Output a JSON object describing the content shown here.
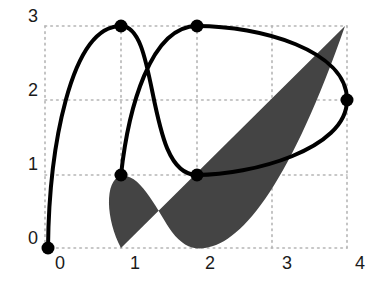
{
  "figure": {
    "axes": {
      "x_ticks": [
        "0",
        "1",
        "2",
        "3",
        "4"
      ],
      "y_ticks": [
        "0",
        "1",
        "2",
        "3"
      ],
      "x_range": [
        0,
        4
      ],
      "y_range": [
        0,
        3
      ]
    },
    "spline_points": [
      {
        "x": 0,
        "y": 0
      },
      {
        "x": 1,
        "y": 3
      },
      {
        "x": 2,
        "y": 1
      },
      {
        "x": 4,
        "y": 2
      },
      {
        "x": 2,
        "y": 3
      },
      {
        "x": 1,
        "y": 1
      }
    ],
    "shaded_region": {
      "start": {
        "x": 1,
        "y": 0
      },
      "end": {
        "x": 4,
        "y": 3
      },
      "fill": "#444444"
    },
    "colors": {
      "curve": "#000000",
      "grid": "#b5b5b5",
      "fill": "#444444"
    }
  }
}
